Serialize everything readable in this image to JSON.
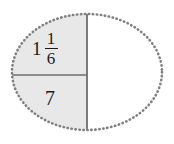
{
  "figure": {
    "type": "fraction-circle-diagram",
    "shape": "ellipse",
    "background_color": "#ffffff",
    "outline": {
      "style": "dotted",
      "color": "#808080",
      "width_px": 2.4
    },
    "shaded_fill_color": "#e8e8e8",
    "unshaded_fill_color": "#ffffff",
    "divider_color": "#6e6e6e",
    "text_color": "#1a1a1a",
    "geometry": {
      "center_x": 87,
      "center_y": 72,
      "radius_x": 75,
      "radius_y": 58,
      "vertical_divider_x": 87,
      "horizontal_divider_y": 75
    },
    "regions": [
      {
        "name": "upper-left",
        "shaded": true,
        "label_type": "mixed-number",
        "whole": "1",
        "numerator": "1",
        "denominator": "6",
        "label_text": "1 1/6"
      },
      {
        "name": "lower-left",
        "shaded": true,
        "label_type": "integer",
        "label_text": "7"
      },
      {
        "name": "right-half",
        "shaded": false,
        "label_type": "none",
        "label_text": ""
      }
    ]
  }
}
